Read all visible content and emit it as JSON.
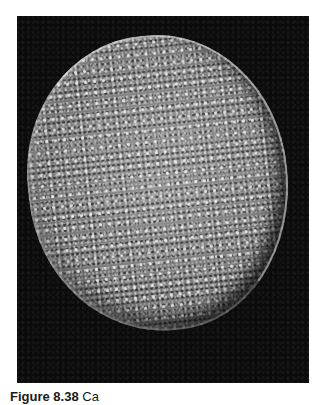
{
  "figure": {
    "image_alt": "Grayscale spacecraft photograph of a heavily cratered moon against a black background",
    "subject_icon": "cratered-moon-photo",
    "colors": {
      "background": "#ffffff",
      "photo_background": "#0b0b0b",
      "surface": "#8a8a8a"
    }
  },
  "caption": {
    "label": "Figure 8.38",
    "text": " Ca"
  }
}
